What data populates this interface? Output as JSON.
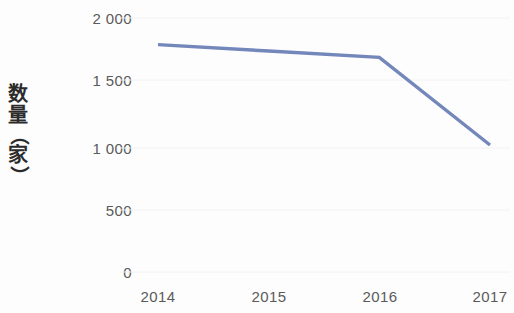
{
  "chart_data": {
    "type": "line",
    "title": "",
    "xlabel": "",
    "ylabel": "数量（家）",
    "categories": [
      "2014",
      "2015",
      "2016",
      "2017"
    ],
    "series": [
      {
        "name": "数量（家）",
        "values": [
          1790,
          1740,
          1690,
          1000
        ],
        "color": "#7387bb"
      }
    ],
    "ylim": [
      0,
      2000
    ],
    "ytick_labels": [
      "2 000",
      "1 500",
      "1 000",
      "500",
      "0"
    ],
    "ytick_values": [
      2000,
      1500,
      1000,
      500,
      0
    ],
    "xtick_labels": [
      "2014",
      "2015",
      "2016",
      "2017"
    ],
    "grid": true,
    "grid_color": "#f2f2f4",
    "legend": false,
    "legend_position": "none",
    "axis_label_color": "#5a5a5a",
    "background_color": "#fdfdfd"
  },
  "y_axis_title_chars": [
    "数",
    "量",
    "（",
    "家",
    "）"
  ]
}
